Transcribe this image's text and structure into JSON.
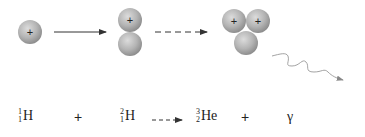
{
  "diagram": {
    "particles": {
      "proton_charge_label": "+",
      "proton_color": "#b8b8b8",
      "neutron_color": "#b8b8b8"
    },
    "stages": [
      {
        "name": "proton",
        "nucleons": [
          {
            "type": "proton"
          }
        ]
      },
      {
        "name": "deuterium",
        "nucleons": [
          {
            "type": "proton"
          },
          {
            "type": "neutron"
          }
        ]
      },
      {
        "name": "helium-3",
        "nucleons": [
          {
            "type": "proton"
          },
          {
            "type": "proton"
          },
          {
            "type": "neutron"
          }
        ]
      },
      {
        "name": "gamma-ray",
        "representation": "wavy arrow"
      }
    ],
    "arrows": [
      {
        "style": "solid",
        "from": "proton",
        "to": "deuterium"
      },
      {
        "style": "dashed",
        "from": "deuterium",
        "to": "helium-3"
      }
    ]
  },
  "equation": {
    "term1": {
      "mass": "1",
      "atomic": "1",
      "symbol": "H"
    },
    "op1": "+",
    "term2": {
      "mass": "2",
      "atomic": "1",
      "symbol": "H"
    },
    "arrow": "dashed",
    "term3": {
      "mass": "3",
      "atomic": "2",
      "symbol": "He"
    },
    "op2": "+",
    "term4": {
      "symbol": "γ"
    }
  },
  "colors": {
    "arrow": "#333333",
    "wave": "#999999",
    "text": "#222222"
  }
}
